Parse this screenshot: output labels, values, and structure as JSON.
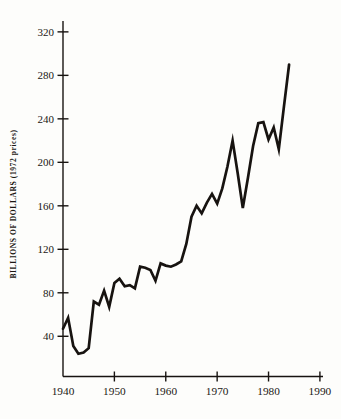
{
  "figure": {
    "background": "#fdfdfb",
    "ink": "#171310"
  },
  "chart_data": {
    "type": "line",
    "title": "",
    "xlabel": "",
    "ylabel": "BILLIONS OF DOLLARS (1972 prices)",
    "x_tick_labels": [
      "1940",
      "1950",
      "1960",
      "1970",
      "1980",
      "1990"
    ],
    "y_tick_labels": [
      "40",
      "80",
      "120",
      "160",
      "200",
      "240",
      "280",
      "320"
    ],
    "xlim": [
      1940,
      1990.6
    ],
    "ylim": [
      3,
      330
    ],
    "grid": false,
    "legend": null,
    "series": [
      {
        "name": "billions-of-dollars-1972-prices",
        "x": [
          1940,
          1941,
          1942,
          1943,
          1944,
          1945,
          1946,
          1947,
          1948,
          1949,
          1950,
          1951,
          1952,
          1953,
          1954,
          1955,
          1956,
          1957,
          1958,
          1959,
          1960,
          1961,
          1962,
          1963,
          1964,
          1965,
          1966,
          1967,
          1968,
          1969,
          1970,
          1971,
          1972,
          1973,
          1974,
          1975,
          1976,
          1977,
          1978,
          1979,
          1980,
          1981,
          1982,
          1983,
          1984
        ],
        "values": [
          47,
          57,
          31,
          24,
          25,
          29,
          72,
          69,
          82,
          67,
          89,
          93,
          86,
          87,
          84,
          104,
          103,
          101,
          91,
          107,
          105,
          104,
          106,
          109,
          125,
          150,
          160,
          153,
          163,
          171,
          162,
          176,
          196,
          220,
          190,
          158,
          186,
          215,
          236,
          237,
          221,
          232,
          212,
          251,
          290
        ]
      }
    ]
  }
}
